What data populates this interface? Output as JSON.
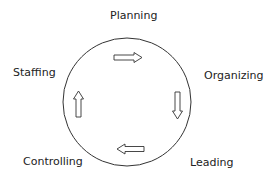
{
  "diagram": {
    "nodes": [
      {
        "id": "planning",
        "label": "Planning"
      },
      {
        "id": "organizing",
        "label": "Organizing"
      },
      {
        "id": "leading",
        "label": "Leading"
      },
      {
        "id": "controlling",
        "label": "Controlling"
      },
      {
        "id": "staffing",
        "label": "Staffing"
      }
    ],
    "arrows": [
      {
        "direction": "right",
        "position": "top"
      },
      {
        "direction": "down",
        "position": "right"
      },
      {
        "direction": "left",
        "position": "bottom"
      },
      {
        "direction": "up",
        "position": "left"
      }
    ],
    "colors": {
      "stroke": "#333333",
      "text": "#222222",
      "background": "#ffffff"
    }
  }
}
